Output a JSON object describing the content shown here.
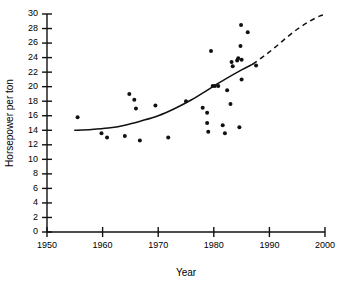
{
  "chart_data": {
    "type": "scatter",
    "title": "",
    "xlabel": "Year",
    "ylabel": "Horsepower per ton",
    "xlim": [
      1950,
      2000
    ],
    "ylim": [
      0,
      30
    ],
    "xticks": [
      1950,
      1960,
      1970,
      1980,
      1990,
      2000
    ],
    "yticks": [
      0,
      2,
      4,
      6,
      8,
      10,
      12,
      14,
      16,
      18,
      20,
      22,
      24,
      26,
      28,
      30
    ],
    "grid": false,
    "legend": "none",
    "point_color": "#111111",
    "line_color": "#111111",
    "points": [
      {
        "x": 1955.5,
        "y": 15.8
      },
      {
        "x": 1959.8,
        "y": 13.6
      },
      {
        "x": 1960.8,
        "y": 13.0
      },
      {
        "x": 1964.0,
        "y": 13.2
      },
      {
        "x": 1964.8,
        "y": 19.0
      },
      {
        "x": 1965.7,
        "y": 18.2
      },
      {
        "x": 1966.0,
        "y": 17.0
      },
      {
        "x": 1966.7,
        "y": 12.6
      },
      {
        "x": 1969.5,
        "y": 17.4
      },
      {
        "x": 1971.8,
        "y": 13.0
      },
      {
        "x": 1975.0,
        "y": 18.0
      },
      {
        "x": 1978.0,
        "y": 17.1
      },
      {
        "x": 1978.8,
        "y": 16.4
      },
      {
        "x": 1978.8,
        "y": 15.0
      },
      {
        "x": 1979.0,
        "y": 13.8
      },
      {
        "x": 1979.5,
        "y": 24.9
      },
      {
        "x": 1979.8,
        "y": 20.1
      },
      {
        "x": 1980.2,
        "y": 20.1
      },
      {
        "x": 1980.8,
        "y": 20.1
      },
      {
        "x": 1981.6,
        "y": 14.7
      },
      {
        "x": 1982.0,
        "y": 13.6
      },
      {
        "x": 1982.4,
        "y": 19.5
      },
      {
        "x": 1983.0,
        "y": 17.6
      },
      {
        "x": 1983.2,
        "y": 23.4
      },
      {
        "x": 1983.4,
        "y": 22.8
      },
      {
        "x": 1984.2,
        "y": 23.6
      },
      {
        "x": 1984.4,
        "y": 23.9
      },
      {
        "x": 1984.6,
        "y": 14.4
      },
      {
        "x": 1984.8,
        "y": 25.6
      },
      {
        "x": 1984.9,
        "y": 28.5
      },
      {
        "x": 1985.0,
        "y": 23.7
      },
      {
        "x": 1985.0,
        "y": 21.0
      },
      {
        "x": 1986.1,
        "y": 27.5
      },
      {
        "x": 1987.6,
        "y": 22.9
      }
    ],
    "fit_curve_solid": [
      {
        "x": 1955.0,
        "y": 14.0
      },
      {
        "x": 1958.0,
        "y": 14.1
      },
      {
        "x": 1961.0,
        "y": 14.3
      },
      {
        "x": 1964.0,
        "y": 14.7
      },
      {
        "x": 1967.0,
        "y": 15.3
      },
      {
        "x": 1970.0,
        "y": 16.0
      },
      {
        "x": 1973.0,
        "y": 17.0
      },
      {
        "x": 1976.0,
        "y": 18.2
      },
      {
        "x": 1979.0,
        "y": 19.6
      },
      {
        "x": 1982.0,
        "y": 21.0
      },
      {
        "x": 1985.0,
        "y": 22.3
      },
      {
        "x": 1987.0,
        "y": 23.1
      }
    ],
    "fit_curve_dashed": [
      {
        "x": 1987.0,
        "y": 23.1
      },
      {
        "x": 1989.0,
        "y": 24.2
      },
      {
        "x": 1991.0,
        "y": 25.4
      },
      {
        "x": 1993.0,
        "y": 26.7
      },
      {
        "x": 1995.0,
        "y": 27.9
      },
      {
        "x": 1997.0,
        "y": 28.9
      },
      {
        "x": 1999.0,
        "y": 29.7
      },
      {
        "x": 2000.0,
        "y": 29.9
      }
    ]
  },
  "axis": {
    "x_title": "Year",
    "y_title": "Horsepower per ton"
  }
}
